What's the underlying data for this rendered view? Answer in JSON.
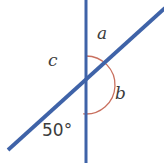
{
  "figure": {
    "background_color": "#ffffff",
    "line_color": "#3f63a8",
    "arc_color": "#c9705f",
    "text_color": "#3c3c3c",
    "intersection": {
      "x": 86,
      "y": 85
    },
    "lines": [
      {
        "name": "vertical-line",
        "x1": 86,
        "y1": 0,
        "x2": 86,
        "y2": 163,
        "stroke_width": 3
      },
      {
        "name": "diagonal-line",
        "x1": 9,
        "y1": 149,
        "x2": 164,
        "y2": 9,
        "stroke_width": 3.6
      }
    ],
    "arc": {
      "name": "angle-arc",
      "center_x": 86,
      "center_y": 85,
      "radius": 29,
      "stroke_width": 1.2,
      "gap_description": "small gap at bottom where arc meets vertical line"
    },
    "labels": {
      "a": "a",
      "b": "b",
      "c": "c",
      "angle_measure": "50°"
    }
  }
}
